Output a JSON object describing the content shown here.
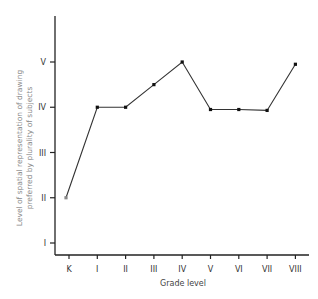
{
  "chart_data": {
    "type": "line",
    "title": "",
    "xlabel": "Grade level",
    "ylabel_lines": [
      "Level of spatial representation of drawing",
      "preferred by plurality of subjects"
    ],
    "categories": [
      "K",
      "I",
      "II",
      "III",
      "IV",
      "V",
      "VI",
      "VII",
      "VIII"
    ],
    "values": [
      2.0,
      4.0,
      4.0,
      4.5,
      5.0,
      3.95,
      3.95,
      3.93,
      4.95
    ],
    "y_ticks": [
      1,
      2,
      3,
      4,
      5
    ],
    "y_tick_labels": [
      "I",
      "II",
      "III",
      "IV",
      "V"
    ],
    "ylim": [
      0.7,
      6.3
    ],
    "grid": false,
    "legend": null,
    "colors": {
      "line": "#333333",
      "axis": "#222222",
      "first_marker": "#888888"
    }
  }
}
